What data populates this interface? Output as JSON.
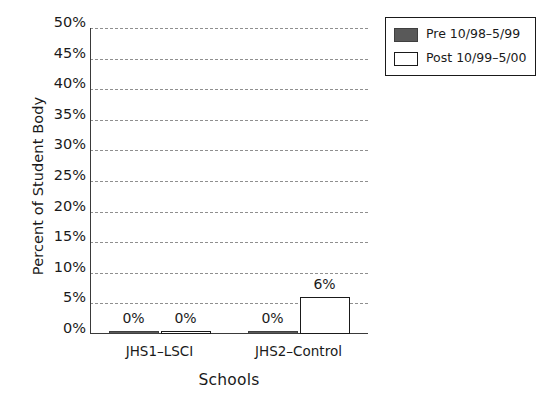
{
  "chart_data": {
    "type": "bar",
    "title": "",
    "xlabel": "Schools",
    "ylabel": "Percent of Student Body",
    "categories": [
      "JHS1–LSCI",
      "JHS2–Control"
    ],
    "series": [
      {
        "name": "Pre 10/98–5/99",
        "color": "#595959",
        "values": [
          0,
          0
        ],
        "labels": [
          "0%",
          "0%"
        ]
      },
      {
        "name": "Post 10/99–5/00",
        "color": "#ffffff",
        "values": [
          0,
          6
        ],
        "labels": [
          "0%",
          "6%"
        ]
      }
    ],
    "ylim": [
      0,
      50
    ],
    "ytick_step": 5,
    "ytick_labels": [
      "0%",
      "5%",
      "10%",
      "15%",
      "20%",
      "25%",
      "30%",
      "35%",
      "40%",
      "45%",
      "50%"
    ],
    "ytick_values": [
      0,
      5,
      10,
      15,
      20,
      25,
      30,
      35,
      40,
      45,
      50
    ],
    "grid": "horizontal-dashed",
    "legend_position": "top-right-outside"
  },
  "legend": {
    "entries": [
      {
        "label": "Pre 10/98–5/99",
        "swatch": "pre-swatch"
      },
      {
        "label": "Post 10/99–5/00",
        "swatch": "post-swatch"
      }
    ]
  },
  "colors": {
    "pre_fill": "#595959",
    "post_fill": "#ffffff",
    "axis": "#3a3a3a",
    "grid": "#8f8f8f",
    "text": "#1a1a1a"
  }
}
